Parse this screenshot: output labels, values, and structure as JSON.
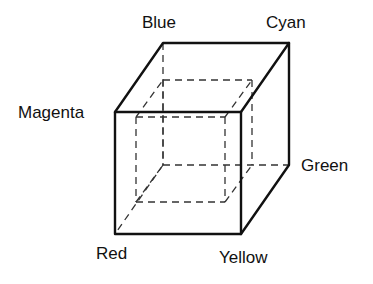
{
  "diagram": {
    "vertex_labels": {
      "blue": "Blue",
      "cyan": "Cyan",
      "magenta": "Magenta",
      "green": "Green",
      "red": "Red",
      "yellow": "Yellow"
    }
  }
}
